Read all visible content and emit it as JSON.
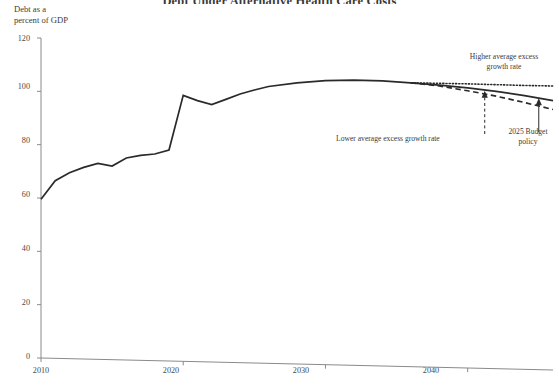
{
  "chart_data": {
    "type": "line",
    "title": "Debt Under Alternative Health Care Costs",
    "ylabel_line1": "Debt as a",
    "ylabel_line2": "percent of GDP",
    "xlabel": "",
    "ylim": [
      0,
      120
    ],
    "xlim": [
      2010,
      2046
    ],
    "yticks": [
      0,
      20,
      40,
      60,
      80,
      100,
      120
    ],
    "xticks": [
      2010,
      2020,
      2030,
      2040
    ],
    "grid": false,
    "legend_position": "annotations-inline",
    "series": [
      {
        "name": "Baseline / 2025 Budget policy",
        "style": "solid",
        "x": [
          2010,
          2011,
          2012,
          2013,
          2014,
          2015,
          2016,
          2017,
          2018,
          2019,
          2020,
          2021,
          2022,
          2023,
          2024,
          2025,
          2026,
          2028,
          2030,
          2032,
          2034,
          2036,
          2038,
          2040,
          2042,
          2044,
          2046
        ],
        "values": [
          59.5,
          66.5,
          69.5,
          71.5,
          73.0,
          72.0,
          75.0,
          76.0,
          76.5,
          78.0,
          98.5,
          96.5,
          95.0,
          97.0,
          99.0,
          100.5,
          101.8,
          103.2,
          104.0,
          104.2,
          103.9,
          103.2,
          102.3,
          101.3,
          100.0,
          98.4,
          96.5
        ]
      },
      {
        "name": "Higher average excess growth rate",
        "style": "dotted",
        "x": [
          2036,
          2038,
          2040,
          2042,
          2044,
          2046
        ],
        "values": [
          103.2,
          103.0,
          102.8,
          102.5,
          102.2,
          102.0
        ]
      },
      {
        "name": "Lower average excess growth rate",
        "style": "dashed",
        "x": [
          2036,
          2038,
          2040,
          2042,
          2044,
          2046
        ],
        "values": [
          103.2,
          102.0,
          100.2,
          98.2,
          95.8,
          93.2
        ]
      }
    ],
    "annotations": [
      {
        "name": "higher-growth-annotation",
        "text_line1": "Higher average excess",
        "text_line2": "growth rate"
      },
      {
        "name": "lower-growth-annotation",
        "text_line1": "Lower average excess growth rate",
        "text_line2": ""
      },
      {
        "name": "budget-policy-annotation",
        "text_line1": "2025 Budget",
        "text_line2": "policy"
      }
    ],
    "colors": {
      "line": "#2a2a2a",
      "axis": "#8a8a8a",
      "text": "#3a3a3a",
      "background": "#ffffff"
    }
  }
}
